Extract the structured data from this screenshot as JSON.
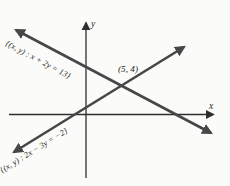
{
  "figure": {
    "type": "coordinate-plane-graph",
    "axes": {
      "x_label": "x",
      "y_label": "y"
    },
    "lines": [
      {
        "name": "descending-line",
        "label": "{(x, y) : x + 2y = 13}",
        "equation": "x + 2y = 13"
      },
      {
        "name": "ascending-line",
        "label": "{(x, y) : 2x − 3y = −2}",
        "equation": "2x − 3y = −2"
      }
    ],
    "intersection": {
      "label": "(5, 4)"
    },
    "colors": {
      "background": "#fbfbf9",
      "line_ink": "#474747",
      "axis_ink": "#2f2f2f",
      "text_ink": "#1d1d1d"
    }
  }
}
